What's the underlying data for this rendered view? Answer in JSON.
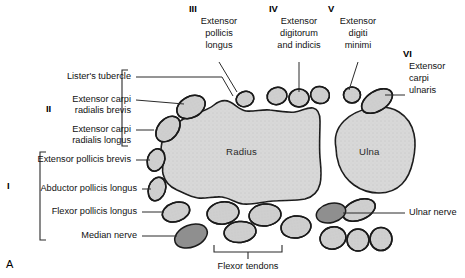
{
  "figure": {
    "panel_letter": "A",
    "type": "anatomical-cross-section",
    "region": "distal forearm / wrist",
    "colors": {
      "bone_fill": "#d8d8d8",
      "tendon_fill": "#d0d0d0",
      "nerve_fill": "#8f8f8f",
      "outline": "#1a1a1a",
      "leader_line": "#2b2b2b",
      "text": "#111111"
    }
  },
  "bones": [
    {
      "name": "Radius",
      "label": "Radius"
    },
    {
      "name": "Ulna",
      "label": "Ulna"
    }
  ],
  "compartments": [
    {
      "numeral": "I",
      "label": "I"
    },
    {
      "numeral": "II",
      "label": "II"
    },
    {
      "numeral": "III",
      "label": "III"
    },
    {
      "numeral": "IV",
      "label": "IV"
    },
    {
      "numeral": "V",
      "label": "V"
    },
    {
      "numeral": "VI",
      "label": "VI"
    }
  ],
  "labels": {
    "listers_tubercle": "Lister's tubercle",
    "ecrb_line1": "Extensor carpi",
    "ecrb_line2": "radialis brevis",
    "ecrl_line1": "Extensor carpi",
    "ecrl_line2": "radialis longus",
    "epb": "Extensor pollicis brevis",
    "apl": "Abductor pollicis longus",
    "fpl": "Flexor pollicis longus",
    "median_nerve": "Median nerve",
    "epl_line1": "Extensor",
    "epl_line2": "pollicis",
    "epl_line3": "longus",
    "edi_line1": "Extensor",
    "edi_line2": "digitorum",
    "edi_line3": "and indicis",
    "edm_line1": "Extensor",
    "edm_line2": "digiti",
    "edm_line3": "minimi",
    "ecu_line1": "Extensor",
    "ecu_line2": "carpi",
    "ecu_line3": "ulnaris",
    "ulnar_nerve": "Ulnar nerve",
    "flexor_tendons": "Flexor tendons"
  }
}
